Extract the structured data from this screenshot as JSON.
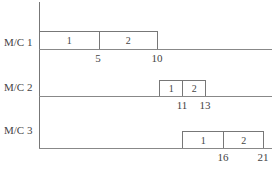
{
  "chart_data": {
    "type": "gantt",
    "title": "",
    "xlabel": "",
    "ylabel": "",
    "rows": [
      {
        "machine": "M/C 1",
        "jobs": [
          {
            "job": "1",
            "start": 0,
            "end": 5
          },
          {
            "job": "2",
            "start": 5,
            "end": 10
          }
        ],
        "tick_labels": [
          "5",
          "10"
        ]
      },
      {
        "machine": "M/C 2",
        "jobs": [
          {
            "job": "1",
            "start": 10,
            "end": 11
          },
          {
            "job": "2",
            "start": 11,
            "end": 13
          }
        ],
        "tick_labels": [
          "11",
          "13"
        ]
      },
      {
        "machine": "M/C 3",
        "jobs": [
          {
            "job": "1",
            "start": 11,
            "end": 16
          },
          {
            "job": "2",
            "start": 16,
            "end": 21
          }
        ],
        "tick_labels": [
          "16",
          "21"
        ]
      }
    ]
  },
  "layout": {
    "rows": [
      {
        "label_y": 36,
        "base_y": 49,
        "bar_top": 31,
        "segs": [
          {
            "x0": 39,
            "x1": 98
          },
          {
            "x0": 98,
            "x1": 157
          }
        ],
        "ticks": [
          {
            "x": 98
          },
          {
            "x": 157
          }
        ]
      },
      {
        "label_y": 81,
        "base_y": 96,
        "bar_top": 80,
        "segs": [
          {
            "x0": 159,
            "x1": 182
          },
          {
            "x0": 182,
            "x1": 205
          }
        ],
        "ticks": [
          {
            "x": 182
          },
          {
            "x": 205
          }
        ]
      },
      {
        "label_y": 124,
        "base_y": 148,
        "bar_top": 131,
        "segs": [
          {
            "x0": 182,
            "x1": 223
          },
          {
            "x0": 223,
            "x1": 263
          }
        ],
        "ticks": [
          {
            "x": 223
          },
          {
            "x": 263
          }
        ]
      }
    ]
  }
}
